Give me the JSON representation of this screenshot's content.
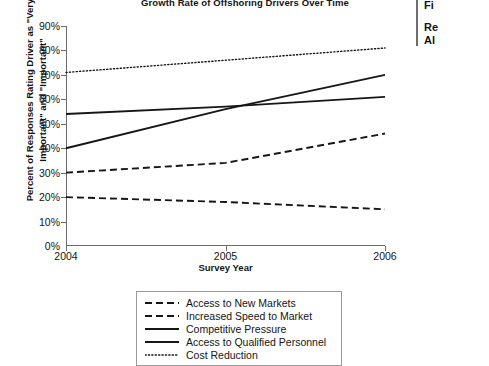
{
  "chart_data": {
    "type": "line",
    "title": "Growth Rate of Offshoring Drivers Over Time",
    "xlabel": "Survey Year",
    "ylabel": "Percent of Responses Rating Driver as \"Very Important\" and \"Important\"",
    "x": [
      2004,
      2005,
      2006
    ],
    "x_tick_labels": [
      "2004",
      "2005",
      "2006"
    ],
    "y_tick_labels": [
      "0%",
      "10%",
      "20%",
      "30%",
      "40%",
      "50%",
      "60%",
      "70%",
      "80%",
      "90%"
    ],
    "y_tick_values": [
      0,
      10,
      20,
      30,
      40,
      50,
      60,
      70,
      80,
      90
    ],
    "ylim": [
      0,
      90
    ],
    "xlim": [
      2004,
      2006
    ],
    "grid": false,
    "legend_position": "below-plot",
    "series": [
      {
        "name": "Access to New Markets",
        "style": "dashed",
        "color": "#161616",
        "values": [
          30,
          34,
          46
        ]
      },
      {
        "name": "Increased Speed to Market",
        "style": "dashed",
        "color": "#161616",
        "values": [
          20,
          18,
          15
        ]
      },
      {
        "name": "Competitive Pressure",
        "style": "solid",
        "color": "#161616",
        "values": [
          40,
          56,
          70
        ]
      },
      {
        "name": "Access to Qualified Personnel",
        "style": "solid",
        "color": "#161616",
        "values": [
          54,
          57,
          61
        ]
      },
      {
        "name": "Cost Reduction",
        "style": "dotted",
        "color": "#161616",
        "values": [
          71,
          76,
          81
        ]
      }
    ]
  },
  "right_panel": {
    "line1": "Fi",
    "line2": "Re",
    "line3": "Al"
  }
}
